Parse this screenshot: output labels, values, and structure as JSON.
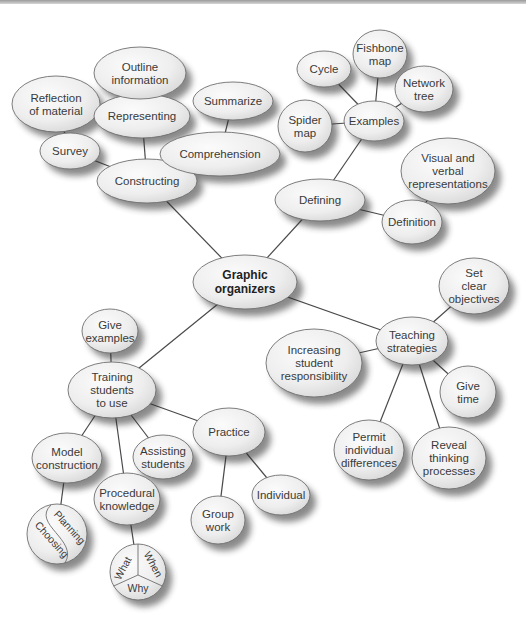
{
  "diagram": {
    "type": "concept-map",
    "center": {
      "id": "graphic-organizers",
      "lines": [
        "Graphic",
        "organizers"
      ],
      "cx": 245,
      "cy": 282,
      "rx": 52,
      "ry": 27
    },
    "nodes": [
      {
        "id": "constructing",
        "lines": [
          "Constructing"
        ],
        "cx": 147,
        "cy": 181,
        "rx": 50,
        "ry": 22
      },
      {
        "id": "survey",
        "lines": [
          "Survey"
        ],
        "cx": 70,
        "cy": 151,
        "rx": 30,
        "ry": 18
      },
      {
        "id": "reflection-of-material",
        "lines": [
          "Reflection",
          "of material"
        ],
        "cx": 56,
        "cy": 104,
        "rx": 44,
        "ry": 28
      },
      {
        "id": "representing",
        "lines": [
          "Representing"
        ],
        "cx": 142,
        "cy": 116,
        "rx": 48,
        "ry": 22
      },
      {
        "id": "outline-information",
        "lines": [
          "Outline",
          "information"
        ],
        "cx": 140,
        "cy": 73,
        "rx": 46,
        "ry": 26
      },
      {
        "id": "summarize",
        "lines": [
          "Summarize"
        ],
        "cx": 233,
        "cy": 101,
        "rx": 40,
        "ry": 19
      },
      {
        "id": "comprehension",
        "lines": [
          "Comprehension"
        ],
        "cx": 220,
        "cy": 154,
        "rx": 60,
        "ry": 22
      },
      {
        "id": "defining",
        "lines": [
          "Defining"
        ],
        "cx": 320,
        "cy": 200,
        "rx": 45,
        "ry": 21
      },
      {
        "id": "examples",
        "lines": [
          "Examples"
        ],
        "cx": 374,
        "cy": 121,
        "rx": 30,
        "ry": 20
      },
      {
        "id": "cycle",
        "lines": [
          "Cycle"
        ],
        "cx": 324,
        "cy": 69,
        "rx": 27,
        "ry": 18
      },
      {
        "id": "fishbone-map",
        "lines": [
          "Fishbone",
          "map"
        ],
        "cx": 380,
        "cy": 54,
        "rx": 27,
        "ry": 24
      },
      {
        "id": "network-tree",
        "lines": [
          "Network",
          "tree"
        ],
        "cx": 424,
        "cy": 89,
        "rx": 29,
        "ry": 23
      },
      {
        "id": "spider-map",
        "lines": [
          "Spider",
          "map"
        ],
        "cx": 305,
        "cy": 126,
        "rx": 27,
        "ry": 26
      },
      {
        "id": "visual-and-verbal-representations",
        "lines": [
          "Visual and",
          "verbal",
          "representations"
        ],
        "cx": 448,
        "cy": 171,
        "rx": 47,
        "ry": 33
      },
      {
        "id": "definition",
        "lines": [
          "Definition"
        ],
        "cx": 412,
        "cy": 222,
        "rx": 30,
        "ry": 22
      },
      {
        "id": "teaching-strategies",
        "lines": [
          "Teaching",
          "strategies"
        ],
        "cx": 412,
        "cy": 341,
        "rx": 36,
        "ry": 24
      },
      {
        "id": "set-clear-objectives",
        "lines": [
          "Set",
          "clear",
          "objectives"
        ],
        "cx": 474,
        "cy": 286,
        "rx": 35,
        "ry": 28
      },
      {
        "id": "increasing-student-responsibility",
        "lines": [
          "Increasing",
          "student",
          "responsibility"
        ],
        "cx": 314,
        "cy": 363,
        "rx": 48,
        "ry": 34
      },
      {
        "id": "give-time",
        "lines": [
          "Give",
          "time"
        ],
        "cx": 468,
        "cy": 392,
        "rx": 28,
        "ry": 26
      },
      {
        "id": "permit-individual-differences",
        "lines": [
          "Permit",
          "individual",
          "differences"
        ],
        "cx": 369,
        "cy": 450,
        "rx": 35,
        "ry": 30
      },
      {
        "id": "reveal-thinking-processes",
        "lines": [
          "Reveal",
          "thinking",
          "processes"
        ],
        "cx": 449,
        "cy": 458,
        "rx": 37,
        "ry": 31
      },
      {
        "id": "training-students-to-use",
        "lines": [
          "Training",
          "students",
          "to use"
        ],
        "cx": 112,
        "cy": 390,
        "rx": 44,
        "ry": 28
      },
      {
        "id": "give-examples",
        "lines": [
          "Give",
          "examples"
        ],
        "cx": 110,
        "cy": 331,
        "rx": 28,
        "ry": 22
      },
      {
        "id": "practice",
        "lines": [
          "Practice"
        ],
        "cx": 229,
        "cy": 432,
        "rx": 36,
        "ry": 24
      },
      {
        "id": "model-construction",
        "lines": [
          "Model",
          "construction"
        ],
        "cx": 67,
        "cy": 458,
        "rx": 35,
        "ry": 25
      },
      {
        "id": "assisting-students",
        "lines": [
          "Assisting",
          "students"
        ],
        "cx": 163,
        "cy": 457,
        "rx": 30,
        "ry": 22
      },
      {
        "id": "procedural-knowledge",
        "lines": [
          "Procedural",
          "knowledge"
        ],
        "cx": 127,
        "cy": 499,
        "rx": 33,
        "ry": 26
      },
      {
        "id": "group-work",
        "lines": [
          "Group",
          "work"
        ],
        "cx": 218,
        "cy": 520,
        "rx": 27,
        "ry": 24
      },
      {
        "id": "individual",
        "lines": [
          "Individual"
        ],
        "cx": 281,
        "cy": 495,
        "rx": 29,
        "ry": 20
      }
    ],
    "special_nodes": {
      "planning_choosing": {
        "cx": 57,
        "cy": 534,
        "r": 30,
        "labels": [
          "Planning",
          "Choosing"
        ]
      },
      "what_when_why": {
        "cx": 138,
        "cy": 572,
        "r": 28,
        "labels": [
          "What",
          "When",
          "Why"
        ]
      }
    },
    "edges": [
      [
        "graphic-organizers",
        "constructing"
      ],
      [
        "graphic-organizers",
        "defining"
      ],
      [
        "graphic-organizers",
        "teaching-strategies"
      ],
      [
        "graphic-organizers",
        "training-students-to-use"
      ],
      [
        "constructing",
        "survey"
      ],
      [
        "constructing",
        "representing"
      ],
      [
        "constructing",
        "comprehension"
      ],
      [
        "survey",
        "reflection-of-material"
      ],
      [
        "representing",
        "outline-information"
      ],
      [
        "comprehension",
        "summarize"
      ],
      [
        "defining",
        "examples"
      ],
      [
        "defining",
        "definition"
      ],
      [
        "examples",
        "cycle"
      ],
      [
        "examples",
        "fishbone-map"
      ],
      [
        "examples",
        "network-tree"
      ],
      [
        "examples",
        "spider-map"
      ],
      [
        "definition",
        "visual-and-verbal-representations"
      ],
      [
        "teaching-strategies",
        "set-clear-objectives"
      ],
      [
        "teaching-strategies",
        "increasing-student-responsibility"
      ],
      [
        "teaching-strategies",
        "give-time"
      ],
      [
        "teaching-strategies",
        "permit-individual-differences"
      ],
      [
        "teaching-strategies",
        "reveal-thinking-processes"
      ],
      [
        "training-students-to-use",
        "give-examples"
      ],
      [
        "training-students-to-use",
        "practice"
      ],
      [
        "training-students-to-use",
        "model-construction"
      ],
      [
        "training-students-to-use",
        "assisting-students"
      ],
      [
        "training-students-to-use",
        "procedural-knowledge"
      ],
      [
        "practice",
        "group-work"
      ],
      [
        "practice",
        "individual"
      ],
      [
        "model-construction",
        "planning_choosing"
      ],
      [
        "procedural-knowledge",
        "what_when_why"
      ]
    ],
    "colors": {
      "node_fill_light": "#fafafa",
      "node_fill_dark": "#dcdcdc",
      "node_stroke": "#6e6e6e",
      "edge": "#4a4a4a",
      "text": "#3a3a3a"
    }
  }
}
